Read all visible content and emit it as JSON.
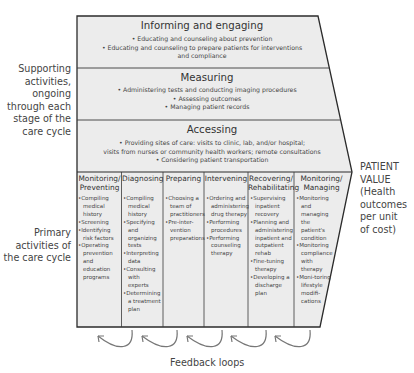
{
  "side_labels": {
    "supporting": [
      "Supporting",
      "activities,",
      "ongoing",
      "through each",
      "stage of the",
      "care cycle"
    ],
    "primary": [
      "Primary",
      "activities of",
      "the care cycle"
    ]
  },
  "supporting_bands": [
    {
      "title": "Informing and engaging",
      "items": [
        "• Educating and counseling about prevention",
        "• Educating and counseling to prepare patients for interventions",
        "and compliance"
      ]
    },
    {
      "title": "Measuring",
      "items": [
        "• Administering tests and conducting imaging procedures",
        "• Assessing outcomes",
        "• Managing patient records"
      ]
    },
    {
      "title": "Accessing",
      "items": [
        "• Providing sites of care: visits to clinic, lab, and/or hospital;",
        "visits from nurses or community health workers; remote consultations",
        "• Considering patient transportation"
      ]
    }
  ],
  "primary_columns": [
    {
      "header": [
        "Monitoring/",
        "Preventing"
      ],
      "items": [
        "Compiling medical history",
        "Screening",
        "Identifying risk factors",
        "Operating prevention and education programs"
      ]
    },
    {
      "header": [
        "Diagnosing"
      ],
      "items": [
        "Compiling medical history",
        "Specifying and organizing tests",
        "Interpreting data",
        "Consulting with experts",
        "Determining a treatment plan"
      ]
    },
    {
      "header": [
        "Preparing"
      ],
      "items": [
        "Choosing a team of practitioners",
        "Pre-inter-vention preparations"
      ]
    },
    {
      "header": [
        "Intervening"
      ],
      "items": [
        "Ordering and administering drug therapy",
        "Performing procedures",
        "Performing counseling therapy"
      ]
    },
    {
      "header": [
        "Recovering/",
        "Rehabilitating"
      ],
      "items": [
        "Supervising inpatient recovery",
        "Planning and administering inpatient and outpatient rehab",
        "Fine-tuning therapy",
        "Developing a discharge plan"
      ]
    },
    {
      "header": [
        "Monitoring/",
        "Managing"
      ],
      "items": [
        "Monitoring and managing the patient's condition",
        "Monitoring compliance with therapy",
        "Moni-toring lifestyle modifi-cations"
      ]
    }
  ],
  "outcome_label": [
    "PATIENT",
    "VALUE",
    "(Health",
    "outcomes",
    "per unit",
    "of cost)"
  ],
  "feedback_label": "Feedback loops",
  "colors": {
    "fill": "#ececec",
    "stroke": "#2b2b2b",
    "text": "#3a3a3a",
    "arrow": "#777777"
  }
}
